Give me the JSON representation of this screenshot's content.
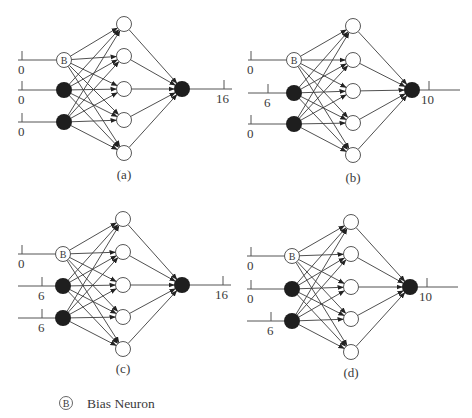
{
  "figure": {
    "width": 472,
    "height": 418,
    "colors": {
      "edge": "#3c3c3c",
      "filled_node": "#1e1e1e",
      "hollow_node_stroke": "#444444",
      "text": "#3a3a3a"
    },
    "node_radius": 7.5,
    "panels": [
      {
        "id": "a",
        "caption": "(a)",
        "caption_pos": [
          124,
          179
        ],
        "inputs": [
          {
            "x": 64,
            "y": 60,
            "type": "bias",
            "line_start": 18,
            "tick_x": 22,
            "value": "0"
          },
          {
            "x": 64,
            "y": 90,
            "type": "filled",
            "line_start": 18,
            "tick_x": 22,
            "value": "0"
          },
          {
            "x": 64,
            "y": 122,
            "type": "filled",
            "line_start": 18,
            "tick_x": 22,
            "value": "0"
          }
        ],
        "hidden": [
          {
            "x": 124,
            "y": 24
          },
          {
            "x": 124,
            "y": 56
          },
          {
            "x": 124,
            "y": 89
          },
          {
            "x": 124,
            "y": 120
          },
          {
            "x": 124,
            "y": 153
          }
        ],
        "output": {
          "x": 182,
          "y": 89,
          "line_end": 232,
          "tick_x": 224,
          "value": "16"
        }
      },
      {
        "id": "b",
        "caption": "(b)",
        "caption_pos": [
          353,
          182
        ],
        "inputs": [
          {
            "x": 294,
            "y": 60,
            "type": "bias",
            "line_start": 248,
            "tick_x": 251,
            "value": "0"
          },
          {
            "x": 294,
            "y": 93,
            "type": "filled",
            "line_start": 248,
            "tick_x": 268,
            "value": "6"
          },
          {
            "x": 294,
            "y": 124,
            "type": "filled",
            "line_start": 248,
            "tick_x": 251,
            "value": "0"
          }
        ],
        "hidden": [
          {
            "x": 353,
            "y": 26
          },
          {
            "x": 353,
            "y": 60
          },
          {
            "x": 353,
            "y": 91
          },
          {
            "x": 353,
            "y": 123
          },
          {
            "x": 353,
            "y": 155
          }
        ],
        "output": {
          "x": 412,
          "y": 90,
          "line_end": 460,
          "tick_x": 429,
          "value": "10"
        }
      },
      {
        "id": "c",
        "caption": "(c)",
        "caption_pos": [
          123,
          373
        ],
        "inputs": [
          {
            "x": 63,
            "y": 254,
            "type": "bias",
            "line_start": 18,
            "tick_x": 22,
            "value": "0"
          },
          {
            "x": 63,
            "y": 286,
            "type": "filled",
            "line_start": 18,
            "tick_x": 42,
            "value": "6"
          },
          {
            "x": 63,
            "y": 318,
            "type": "filled",
            "line_start": 18,
            "tick_x": 42,
            "value": "6"
          }
        ],
        "hidden": [
          {
            "x": 123,
            "y": 219
          },
          {
            "x": 123,
            "y": 252
          },
          {
            "x": 123,
            "y": 285
          },
          {
            "x": 123,
            "y": 317
          },
          {
            "x": 123,
            "y": 349
          }
        ],
        "output": {
          "x": 182,
          "y": 285,
          "line_end": 231,
          "tick_x": 223,
          "value": "16"
        }
      },
      {
        "id": "d",
        "caption": "(d)",
        "caption_pos": [
          351,
          377
        ],
        "inputs": [
          {
            "x": 292,
            "y": 256,
            "type": "bias",
            "line_start": 247,
            "tick_x": 251,
            "value": "0"
          },
          {
            "x": 292,
            "y": 289,
            "type": "filled",
            "line_start": 247,
            "tick_x": 251,
            "value": "0"
          },
          {
            "x": 292,
            "y": 321,
            "type": "filled",
            "line_start": 247,
            "tick_x": 271,
            "value": "6"
          }
        ],
        "hidden": [
          {
            "x": 351,
            "y": 222
          },
          {
            "x": 351,
            "y": 254
          },
          {
            "x": 351,
            "y": 287
          },
          {
            "x": 351,
            "y": 319
          },
          {
            "x": 351,
            "y": 352
          }
        ],
        "output": {
          "x": 410,
          "y": 287,
          "line_end": 458,
          "tick_x": 427,
          "value": "10"
        }
      }
    ],
    "bias_letter": "B",
    "legend": {
      "symbol_letter": "B",
      "symbol_pos": [
        66,
        403
      ],
      "label": "Bias Neuron",
      "label_pos": [
        87,
        408
      ]
    }
  }
}
